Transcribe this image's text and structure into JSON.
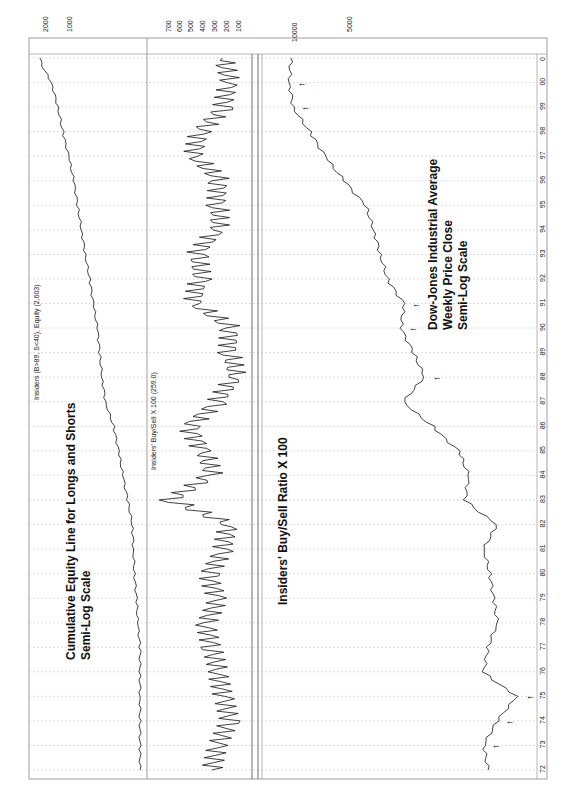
{
  "chart_data": [
    {
      "type": "line",
      "panel": "equity",
      "title": "Insiders (B>89, S<40), Equity (2,603)",
      "annotation": [
        "Cumulative Equity Line for Longs and Shorts",
        "Semi-Log Scale"
      ],
      "orientation": "rotated 90° clockwise (time runs bottom-to-top)",
      "xlabel": "Year",
      "ylabel": "Equity",
      "yscale": "log",
      "ytick_labels": [
        "2000",
        "1000"
      ],
      "x": [
        "72",
        "73",
        "74",
        "75",
        "76",
        "77",
        "78",
        "79",
        "80",
        "81",
        "82",
        "83",
        "84",
        "85",
        "86",
        "87",
        "88",
        "89",
        "90",
        "91",
        "92",
        "93",
        "94",
        "95",
        "96",
        "97",
        "98",
        "99",
        "00",
        "0"
      ],
      "values": [
        100,
        105,
        110,
        120,
        130,
        140,
        150,
        155,
        165,
        170,
        175,
        200,
        230,
        260,
        300,
        380,
        420,
        450,
        480,
        540,
        600,
        680,
        760,
        850,
        950,
        1100,
        1300,
        1500,
        1800,
        2603
      ]
    },
    {
      "type": "line",
      "panel": "insiders-buy-sell",
      "title": "Insiders' Buy/Sell  X  100 (259.0)",
      "annotation": [
        "Insiders' Buy/Sell Ratio X 100"
      ],
      "ylabel": "Buy/Sell x 100",
      "ytick_labels": [
        "700",
        "600",
        "500",
        "400",
        "300",
        "200",
        "100"
      ],
      "reference_lines": [
        89,
        40
      ],
      "x": [
        "72",
        "73",
        "74",
        "75",
        "76",
        "77",
        "78",
        "79",
        "80",
        "81",
        "82",
        "83",
        "84",
        "85",
        "86",
        "87",
        "88",
        "89",
        "90",
        "91",
        "92",
        "93",
        "94",
        "95",
        "96",
        "97",
        "98",
        "99",
        "00",
        "0"
      ],
      "values": [
        350,
        300,
        200,
        250,
        300,
        350,
        400,
        300,
        380,
        250,
        200,
        700,
        350,
        420,
        550,
        300,
        150,
        200,
        180,
        500,
        450,
        480,
        300,
        300,
        280,
        500,
        450,
        250,
        200,
        259
      ]
    },
    {
      "type": "line",
      "panel": "djia",
      "title": "Dow-Jones Industrial Average",
      "annotation": [
        "Dow-Jones Industrial Average",
        "Weekly Price Close",
        "Semi-Log Scale"
      ],
      "ylabel": "DJIA",
      "yscale": "log",
      "ytick_labels": [
        "10000",
        "5000"
      ],
      "x": [
        "72",
        "73",
        "74",
        "75",
        "76",
        "77",
        "78",
        "79",
        "80",
        "81",
        "82",
        "83",
        "84",
        "85",
        "86",
        "87",
        "88",
        "89",
        "90",
        "91",
        "92",
        "93",
        "94",
        "95",
        "96",
        "97",
        "98",
        "99",
        "00",
        "0"
      ],
      "values": [
        900,
        950,
        800,
        620,
        950,
        900,
        800,
        840,
        880,
        950,
        800,
        1200,
        1150,
        1300,
        1800,
        2600,
        2000,
        2300,
        2700,
        2600,
        3200,
        3500,
        3800,
        4200,
        5500,
        7000,
        8500,
        10500,
        11000,
        10800
      ],
      "signal_arrows_at": [
        "73",
        "74",
        "75",
        "88",
        "90",
        "91",
        "99",
        "00"
      ]
    }
  ],
  "axis": {
    "time_ticks": [
      "0",
      "00",
      "99",
      "98",
      "97",
      "96",
      "95",
      "94",
      "93",
      "92",
      "91",
      "90",
      "89",
      "88",
      "87",
      "86",
      "85",
      "84",
      "83",
      "82",
      "81",
      "80",
      "79",
      "78",
      "77",
      "76",
      "75",
      "74",
      "73",
      "72"
    ]
  },
  "labels": {
    "equity_title": "Insiders (B>89, S<40), Equity (2,603)",
    "ratio_title": "Insiders' Buy/Sell  X  100 (259.0)",
    "equity_annot_1": "Cumulative Equity Line for Longs and Shorts",
    "equity_annot_2": "Semi-Log Scale",
    "ratio_annot": "Insiders' Buy/Sell Ratio X 100",
    "djia_annot_1": "Dow-Jones Industrial Average",
    "djia_annot_2": "Weekly Price Close",
    "djia_annot_3": "Semi-Log Scale",
    "eq_tick_2000": "2000",
    "eq_tick_1000": "1000",
    "r_700": "700",
    "r_600": "600",
    "r_500": "500",
    "r_400": "400",
    "r_300": "300",
    "r_200": "200",
    "r_100": "100",
    "dj_10000": "10000",
    "dj_5000": "5000"
  }
}
